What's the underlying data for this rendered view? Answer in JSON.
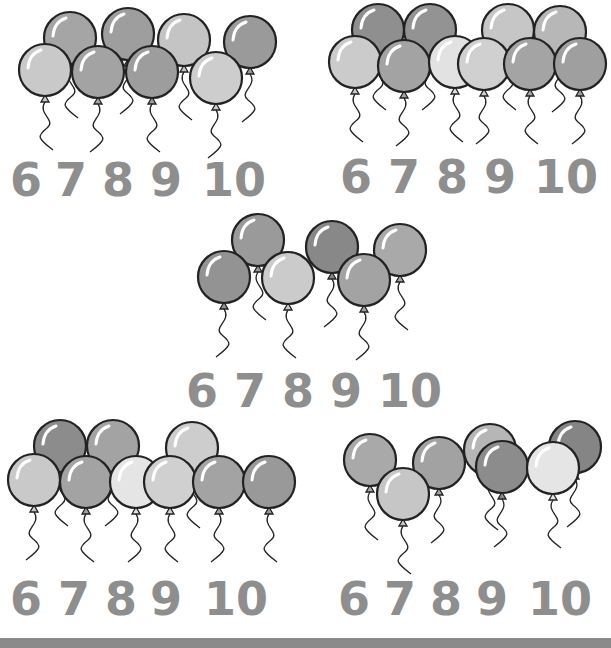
{
  "worksheet": {
    "groups": [
      {
        "id": "group-1",
        "balloon_count": 8,
        "choices": [
          "6",
          "7",
          "8",
          "9",
          "10"
        ],
        "balloon_shades": [
          "#a5a5a5",
          "#9e9e9e",
          "#c4c4c4",
          "#9a9a9a",
          "#c9c9c9",
          "#a3a3a3",
          "#9d9d9d",
          "#cdcdcd"
        ]
      },
      {
        "id": "group-2",
        "balloon_count": 10,
        "choices": [
          "6",
          "7",
          "8",
          "9",
          "10"
        ],
        "balloon_shades": [
          "#8f8f8f",
          "#939393",
          "#c6c6c6",
          "#b7b7b7",
          "#cbcbcb",
          "#a3a3a3",
          "#e2e2e2",
          "#d0d0d0",
          "#a4a4a4",
          "#9f9f9f"
        ]
      },
      {
        "id": "group-3",
        "balloon_count": 6,
        "choices": [
          "6",
          "7",
          "8",
          "9",
          "10"
        ],
        "balloon_shades": [
          "#9a9a9a",
          "#888888",
          "#a9a9a9",
          "#939393",
          "#cbcbcb",
          "#a3a3a3"
        ]
      },
      {
        "id": "group-4",
        "balloon_count": 9,
        "choices": [
          "6",
          "7",
          "8",
          "9",
          "10"
        ],
        "balloon_shades": [
          "#8c8c8c",
          "#a3a3a3",
          "#cdcdcd",
          "#c9c9c9",
          "#a3a3a3",
          "#e5e5e5",
          "#d0d0d0",
          "#a3a3a3",
          "#999999"
        ]
      },
      {
        "id": "group-5",
        "balloon_count": 7,
        "choices": [
          "6",
          "7",
          "8",
          "9",
          "10"
        ],
        "balloon_shades": [
          "#a9a9a9",
          "#a2a2a2",
          "#b6b6b6",
          "#858585",
          "#c6c6c6",
          "#8c8c8c",
          "#e5e5e5"
        ]
      }
    ],
    "outline_color": "#222222",
    "number_color": "#8e8e8e",
    "footer_bar_color": "#8a8a8a"
  }
}
